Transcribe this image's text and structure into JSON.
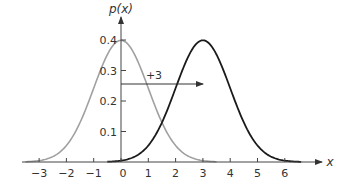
{
  "chart_data": {
    "type": "line",
    "title": "",
    "xlabel": "x",
    "ylabel": "p(x)",
    "xlim": [
      -3.5,
      7
    ],
    "ylim": [
      0,
      0.42
    ],
    "x_ticks": [
      -3,
      -2,
      -1,
      0,
      1,
      2,
      3,
      4,
      5,
      6
    ],
    "x_tick_labels": [
      "−3",
      "−2",
      "−1",
      "0",
      "1",
      "2",
      "3",
      "4",
      "5",
      "6"
    ],
    "y_ticks": [
      0.1,
      0.2,
      0.3,
      0.4
    ],
    "y_tick_labels": [
      "0.1",
      "0.2",
      "0.3",
      "0.4"
    ],
    "grid": false,
    "legend": null,
    "series": [
      {
        "name": "standard normal (mean 0)",
        "mean": 0,
        "sd": 1,
        "color": "#a0a0a0",
        "x_range": [
          -3.5,
          3.5
        ],
        "points": [
          [
            -3,
            0.0044
          ],
          [
            -2,
            0.054
          ],
          [
            -1,
            0.242
          ],
          [
            0,
            0.399
          ],
          [
            1,
            0.242
          ],
          [
            2,
            0.054
          ],
          [
            3,
            0.0044
          ]
        ]
      },
      {
        "name": "shifted normal (mean 3)",
        "mean": 3,
        "sd": 1,
        "color": "#1a1a1a",
        "x_range": [
          -0.5,
          6.6
        ],
        "points": [
          [
            0,
            0.0044
          ],
          [
            1,
            0.054
          ],
          [
            2,
            0.242
          ],
          [
            3,
            0.399
          ],
          [
            4,
            0.242
          ],
          [
            5,
            0.054
          ],
          [
            6,
            0.0044
          ]
        ]
      }
    ],
    "annotations": [
      {
        "type": "arrow",
        "from": [
          0,
          0.25
        ],
        "to": [
          3,
          0.25
        ],
        "label": "+3"
      }
    ]
  },
  "labels": {
    "ylabel": "p(x)",
    "xlabel": "x",
    "shift": "+3"
  }
}
